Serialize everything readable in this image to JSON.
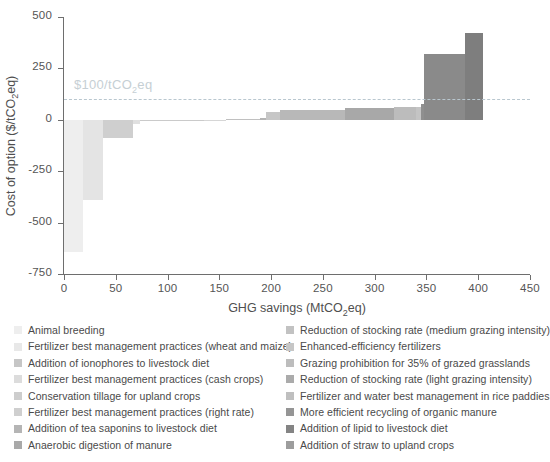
{
  "chart_data": {
    "type": "bar",
    "title": "",
    "subtitle": "",
    "xlabel": "GHG savings (MtCO2eq)",
    "xlabel_parts": {
      "pre": "GHG savings (MtCO",
      "sub": "2",
      "post": "eq)"
    },
    "ylabel": "Cost of option ($/tCO2eq)",
    "ylabel_parts": {
      "pre": "Cost of option ($/tCO",
      "sub": "2",
      "post": "eq)"
    },
    "xlim": [
      0,
      450
    ],
    "ylim": [
      -750,
      500
    ],
    "xticks": [
      0,
      50,
      100,
      150,
      200,
      250,
      300,
      350,
      400,
      450
    ],
    "xticklabels": [
      "0",
      "50",
      "100",
      "150",
      "200",
      "250",
      "300",
      "350",
      "400",
      "450"
    ],
    "yticks": [
      500,
      250,
      0,
      -250,
      -500,
      -750
    ],
    "yticklabels": [
      "500",
      "250",
      "0",
      "-250",
      "-500",
      "-750"
    ],
    "grid": false,
    "legend_position": "below-two-columns",
    "annotations": [
      {
        "name": "threshold-line",
        "type": "hline",
        "y": 100,
        "label": "$100/tCO2eq",
        "label_parts": {
          "pre": "$100/tCO",
          "sub": "2",
          "post": "eq"
        },
        "color": "#b9c7cf",
        "style": "dashed"
      }
    ],
    "note": "Marginal abatement cost curve. Each bar width = GHG savings potential (MtCO2eq), bar height = cost of option ($/tCO2eq). Bars sorted left to right by increasing cost.",
    "categories": [
      "Animal breeding",
      "Fertilizer best management practices (wheat and maize)",
      "Addition of ionophores to livestock diet",
      "Fertilizer best management practices (cash crops)",
      "Conservation tillage for upland crops",
      "Fertilizer best management practices (right rate)",
      "Addition of tea saponins to livestock diet",
      "Anaerobic digestion of manure",
      "Reduction of stocking rate (medium grazing intensity)",
      "Enhanced-efficiency fertilizers",
      "Grazing prohibition for 35% of grazed grasslands",
      "Reduction of stocking rate (light grazing intensity)",
      "Fertilizer and water best management in rice paddies",
      "More efficient recycling of organic manure",
      "Addition of lipid to livestock diet",
      "Addition of straw to upland crops"
    ],
    "bars": [
      {
        "label": "Animal breeding",
        "x_start": 0,
        "width": 18,
        "cost": -645,
        "color": "#eeeeee"
      },
      {
        "label": "Fertilizer best management practices (wheat and maize)",
        "x_start": 18,
        "width": 20,
        "cost": -392,
        "color": "#e4e4e4"
      },
      {
        "label": "Addition of ionophores to livestock diet",
        "x_start": 38,
        "width": 29,
        "cost": -88,
        "color": "#cfcfcf"
      },
      {
        "label": "Fertilizer best management practices (cash crops)",
        "x_start": 67,
        "width": 6,
        "cost": -20,
        "color": "#e0e0e0"
      },
      {
        "label": "Conservation tillage for upland crops",
        "x_start": 73,
        "width": 62,
        "cost": -8,
        "color": "#cacaca"
      },
      {
        "label": "Fertilizer best management practices (right rate)",
        "x_start": 135,
        "width": 21,
        "cost": -3,
        "color": "#d6d6d6"
      },
      {
        "label": "Addition of tea saponins to livestock diet",
        "x_start": 156,
        "width": 33,
        "cost": 5,
        "color": "#c0c0c0"
      },
      {
        "label": "Anaerobic digestion of manure",
        "x_start": 189,
        "width": 6,
        "cost": 8,
        "color": "#b4b4b4"
      },
      {
        "label": "Reduction of stocking rate (medium grazing intensity)",
        "x_start": 195,
        "width": 14,
        "cost": 40,
        "color": "#c6c6c6"
      },
      {
        "label": "Enhanced-efficiency fertilizers",
        "x_start": 209,
        "width": 62,
        "cost": 48,
        "color": "#b8b8b8"
      },
      {
        "label": "Grazing prohibition for 35% of grazed grasslands",
        "x_start": 271,
        "width": 48,
        "cost": 57,
        "color": "#a8a8a8"
      },
      {
        "label": "Reduction of stocking rate (light grazing intensity)",
        "x_start": 319,
        "width": 21,
        "cost": 60,
        "color": "#bcbcbc"
      },
      {
        "label": "Fertilizer and water best management in rice paddies",
        "x_start": 340,
        "width": 5,
        "cost": 62,
        "color": "#c4c4c4"
      },
      {
        "label": "More efficient recycling of organic manure",
        "x_start": 345,
        "width": 3,
        "cost": 75,
        "color": "#8f8f8f"
      },
      {
        "label": "Addition of lipid to livestock diet",
        "x_start": 348,
        "width": 39,
        "cost": 320,
        "color": "#8a8a8a"
      },
      {
        "label": "Addition of straw to upland crops",
        "x_start": 387,
        "width": 18,
        "cost": 420,
        "color": "#7e7e7e"
      }
    ]
  },
  "legend": {
    "left": [
      {
        "label": "Animal breeding",
        "color": "#eeeeee"
      },
      {
        "label": "Fertilizer best management practices (wheat and maize)",
        "color": "#e8e8e8"
      },
      {
        "label": "Addition of ionophores to livestock diet",
        "color": "#c6c6c6"
      },
      {
        "label": "Fertilizer best management practices (cash crops)",
        "color": "#dcdcdc"
      },
      {
        "label": "Conservation tillage for upland crops",
        "color": "#cdcdcd"
      },
      {
        "label": "Fertilizer best management practices (right rate)",
        "color": "#cfcfcf"
      },
      {
        "label": "Addition of tea saponins to livestock diet",
        "color": "#b5b5b5"
      },
      {
        "label": "Anaerobic digestion of manure",
        "color": "#a9a9a9"
      }
    ],
    "right": [
      {
        "label": "Reduction of stocking rate (medium grazing intensity)",
        "color": "#c2c2c2"
      },
      {
        "label": "Enhanced-efficiency fertilizers",
        "color": "#c6c6c6"
      },
      {
        "label": "Grazing prohibition for 35% of grazed grasslands",
        "color": "#bdbdbd"
      },
      {
        "label": "Reduction of stocking rate (light grazing intensity)",
        "color": "#ababab"
      },
      {
        "label": "Fertilizer and water best management in rice paddies",
        "color": "#bfbfbf"
      },
      {
        "label": "More efficient recycling of organic manure",
        "color": "#959595"
      },
      {
        "label": "Addition of lipid to livestock diet",
        "color": "#848484"
      },
      {
        "label": "Addition of straw to upland crops",
        "color": "#9d9d9d"
      }
    ]
  }
}
